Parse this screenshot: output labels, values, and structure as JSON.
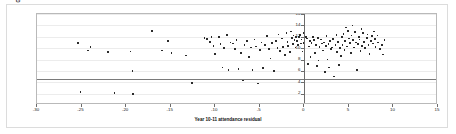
{
  "chart_data": {
    "type": "scatter",
    "title": "",
    "xlabel": "Year 10-11 attendance residual",
    "ylabel": "GCSE passes A*-G",
    "xlim": [
      -30,
      15
    ],
    "ylim": [
      0,
      16
    ],
    "xticks": [
      -30,
      -25,
      -20,
      -15,
      -10,
      -5,
      0,
      5,
      10,
      15
    ],
    "xtick_labels": [
      "-30",
      "-25",
      "-20",
      "-15",
      "-10",
      "-5",
      "0",
      "5",
      "10",
      "15"
    ],
    "yticks": [
      0,
      2,
      4,
      6,
      8,
      10,
      12,
      14,
      16
    ],
    "ytick_labels": [
      "0",
      "2",
      "4",
      "6",
      "8",
      "10",
      "12",
      "14",
      "16"
    ],
    "grid": true,
    "grid_axis": "y",
    "legend": false,
    "legend_position": "none",
    "reference_lines": [
      {
        "orientation": "horizontal",
        "value": 4.6,
        "color": "#7a7a7a"
      },
      {
        "orientation": "horizontal",
        "value": 0,
        "color": "#6b6b6b"
      },
      {
        "orientation": "vertical",
        "value": 0,
        "color": "#6b6b6b"
      }
    ],
    "marker": {
      "shape": "square",
      "color": "#2b2b2b",
      "size": 1.7
    },
    "points": [
      [
        -25.4,
        10.9
      ],
      [
        -24.3,
        9.6
      ],
      [
        -24.0,
        10.2
      ],
      [
        -25.1,
        2.3
      ],
      [
        -22.0,
        9.3
      ],
      [
        -21.3,
        2.1
      ],
      [
        -19.5,
        9.4
      ],
      [
        -19.3,
        6.0
      ],
      [
        -19.2,
        1.9
      ],
      [
        -17.1,
        13.0
      ],
      [
        -16.0,
        9.6
      ],
      [
        -15.3,
        11.2
      ],
      [
        -14.9,
        9.1
      ],
      [
        -13.3,
        8.7
      ],
      [
        -12.6,
        3.9
      ],
      [
        -11.2,
        11.8
      ],
      [
        -10.9,
        11.6
      ],
      [
        -10.6,
        11.1
      ],
      [
        -10.4,
        12.0
      ],
      [
        -10.2,
        10.4
      ],
      [
        -10.0,
        9.0
      ],
      [
        -9.6,
        11.9
      ],
      [
        -9.4,
        10.7
      ],
      [
        -9.2,
        6.6
      ],
      [
        -9.0,
        10.0
      ],
      [
        -8.7,
        12.3
      ],
      [
        -8.5,
        6.2
      ],
      [
        -8.3,
        11.0
      ],
      [
        -8.0,
        10.8
      ],
      [
        -7.8,
        9.8
      ],
      [
        -7.6,
        11.4
      ],
      [
        -7.4,
        6.3
      ],
      [
        -7.1,
        9.2
      ],
      [
        -6.9,
        4.3
      ],
      [
        -6.7,
        10.6
      ],
      [
        -6.4,
        11.2
      ],
      [
        -6.2,
        8.4
      ],
      [
        -6.0,
        10.1
      ],
      [
        -5.8,
        6.1
      ],
      [
        -5.6,
        11.5
      ],
      [
        -5.4,
        10.3
      ],
      [
        -5.2,
        3.8
      ],
      [
        -5.0,
        9.7
      ],
      [
        -4.8,
        11.0
      ],
      [
        -4.6,
        6.5
      ],
      [
        -4.4,
        10.5
      ],
      [
        -4.2,
        12.1
      ],
      [
        -4.0,
        9.9
      ],
      [
        -3.8,
        8.2
      ],
      [
        -3.6,
        10.9
      ],
      [
        -3.4,
        6.0
      ],
      [
        -3.2,
        11.3
      ],
      [
        -3.0,
        10.0
      ],
      [
        -2.9,
        12.4
      ],
      [
        -2.7,
        9.5
      ],
      [
        -2.5,
        11.7
      ],
      [
        -2.4,
        10.2
      ],
      [
        -2.2,
        8.8
      ],
      [
        -2.0,
        12.6
      ],
      [
        -1.9,
        11.1
      ],
      [
        -1.8,
        10.4
      ],
      [
        -1.6,
        9.3
      ],
      [
        -1.5,
        12.9
      ],
      [
        -1.4,
        11.8
      ],
      [
        -1.3,
        10.7
      ],
      [
        -1.2,
        12.2
      ],
      [
        -1.1,
        11.4
      ],
      [
        -1.0,
        10.1
      ],
      [
        -0.9,
        12.0
      ],
      [
        -0.8,
        11.2
      ],
      [
        -0.7,
        10.5
      ],
      [
        -0.6,
        11.9
      ],
      [
        -0.5,
        12.3
      ],
      [
        -0.4,
        10.8
      ],
      [
        -0.3,
        11.5
      ],
      [
        -0.2,
        9.4
      ],
      [
        -0.1,
        12.7
      ],
      [
        -0.1,
        10.9
      ],
      [
        0.2,
        11.9
      ],
      [
        0.3,
        11.7
      ],
      [
        0.5,
        10.3
      ],
      [
        0.6,
        11.2
      ],
      [
        0.7,
        8.4
      ],
      [
        0.8,
        10.9
      ],
      [
        1.0,
        12.0
      ],
      [
        1.1,
        11.4
      ],
      [
        1.2,
        9.1
      ],
      [
        1.3,
        10.6
      ],
      [
        1.5,
        11.8
      ],
      [
        1.6,
        7.8
      ],
      [
        1.7,
        10.2
      ],
      [
        1.9,
        11.5
      ],
      [
        2.0,
        10.8
      ],
      [
        2.1,
        9.6
      ],
      [
        2.2,
        11.0
      ],
      [
        2.4,
        10.4
      ],
      [
        2.5,
        12.1
      ],
      [
        2.6,
        8.0
      ],
      [
        2.7,
        10.7
      ],
      [
        2.9,
        11.3
      ],
      [
        3.0,
        9.9
      ],
      [
        3.1,
        10.1
      ],
      [
        3.2,
        11.6
      ],
      [
        3.3,
        5.0
      ],
      [
        3.5,
        10.5
      ],
      [
        3.6,
        12.3
      ],
      [
        3.7,
        9.3
      ],
      [
        3.8,
        11.1
      ],
      [
        4.0,
        10.0
      ],
      [
        4.1,
        8.6
      ],
      [
        4.2,
        11.9
      ],
      [
        4.3,
        10.6
      ],
      [
        4.4,
        12.5
      ],
      [
        4.5,
        9.7
      ],
      [
        4.6,
        11.2
      ],
      [
        4.8,
        10.3
      ],
      [
        4.9,
        13.0
      ],
      [
        5.0,
        11.7
      ],
      [
        5.1,
        10.9
      ],
      [
        5.2,
        9.2
      ],
      [
        5.3,
        12.2
      ],
      [
        5.5,
        11.4
      ],
      [
        5.6,
        10.1
      ],
      [
        5.7,
        12.8
      ],
      [
        5.8,
        11.0
      ],
      [
        5.9,
        6.2
      ],
      [
        6.0,
        10.7
      ],
      [
        6.1,
        12.0
      ],
      [
        6.2,
        11.5
      ],
      [
        6.3,
        9.5
      ],
      [
        6.5,
        10.4
      ],
      [
        6.6,
        12.6
      ],
      [
        6.7,
        11.1
      ],
      [
        6.8,
        10.0
      ],
      [
        7.0,
        11.8
      ],
      [
        7.1,
        12.4
      ],
      [
        7.2,
        10.6
      ],
      [
        7.3,
        9.0
      ],
      [
        7.5,
        11.3
      ],
      [
        7.6,
        12.1
      ],
      [
        7.7,
        10.8
      ],
      [
        7.9,
        11.6
      ],
      [
        8.0,
        10.2
      ],
      [
        8.2,
        12.2
      ],
      [
        8.3,
        11.0
      ],
      [
        8.5,
        9.8
      ],
      [
        8.7,
        10.5
      ],
      [
        9.0,
        11.4
      ],
      [
        5.4,
        14.0
      ],
      [
        6.4,
        13.4
      ],
      [
        4.7,
        13.6
      ],
      [
        7.8,
        12.9
      ],
      [
        2.8,
        6.6
      ],
      [
        3.9,
        7.0
      ],
      [
        1.4,
        6.9
      ],
      [
        0.4,
        7.2
      ],
      [
        8.8,
        8.9
      ],
      [
        2.3,
        5.8
      ]
    ]
  }
}
